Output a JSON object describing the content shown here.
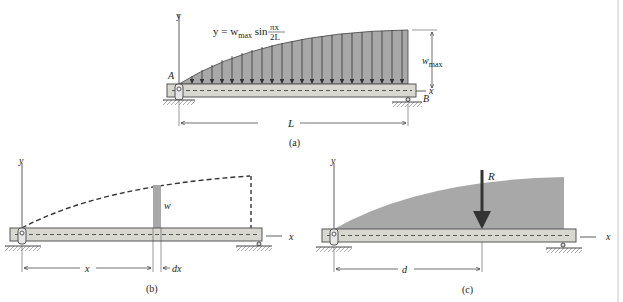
{
  "figure_a": {
    "equation_prefix": "y = w",
    "equation_sub": "max",
    "equation_sin": " sin ",
    "frac_num": "πx",
    "frac_den": "2L",
    "label_A": "A",
    "label_B": "B",
    "label_y": "y",
    "label_x": "x",
    "label_w": "w",
    "label_w_sub": "max",
    "label_L": "L",
    "caption": "(a)"
  },
  "figure_b": {
    "label_y": "y",
    "label_x": "x",
    "label_w": "w",
    "label_xdist": "x",
    "label_dx": "dx",
    "caption": "(b)"
  },
  "figure_c": {
    "label_y": "y",
    "label_x": "x",
    "label_R": "R",
    "label_d": "d",
    "caption": "(c)"
  },
  "colors": {
    "load_fill": "#a8a8a8",
    "beam_fill": "#d8d8d0",
    "beam_edge": "#555555",
    "line": "#333333"
  }
}
